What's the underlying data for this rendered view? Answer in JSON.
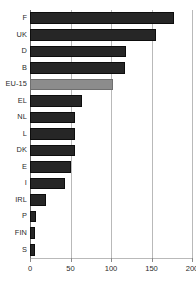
{
  "chart_data": {
    "type": "bar",
    "orientation": "horizontal",
    "title": "",
    "xlabel": "",
    "ylabel": "",
    "xlim": [
      0,
      200
    ],
    "ylim": null,
    "grid": true,
    "legend": null,
    "xticks": [
      0,
      50,
      100,
      150,
      200
    ],
    "xtick_labels": [
      "0",
      "50",
      "100",
      "150",
      "200"
    ],
    "categories": [
      "F",
      "UK",
      "D",
      "B",
      "EU-15",
      "EL",
      "NL",
      "L",
      "DK",
      "E",
      "I",
      "IRL",
      "P",
      "FIN",
      "S"
    ],
    "values": [
      178,
      155,
      118,
      117,
      102,
      64,
      56,
      55,
      55,
      51,
      43,
      20,
      7,
      6,
      6
    ],
    "bars": [
      {
        "label": "F",
        "value": 178,
        "color": "#262626",
        "highlight": false
      },
      {
        "label": "UK",
        "value": 155,
        "color": "#262626",
        "highlight": false
      },
      {
        "label": "D",
        "value": 118,
        "color": "#262626",
        "highlight": false
      },
      {
        "label": "B",
        "value": 117,
        "color": "#262626",
        "highlight": false
      },
      {
        "label": "EU-15",
        "value": 102,
        "color": "#8c8c8c",
        "highlight": true
      },
      {
        "label": "EL",
        "value": 64,
        "color": "#262626",
        "highlight": false
      },
      {
        "label": "NL",
        "value": 56,
        "color": "#262626",
        "highlight": false
      },
      {
        "label": "L",
        "value": 55,
        "color": "#262626",
        "highlight": false
      },
      {
        "label": "DK",
        "value": 55,
        "color": "#262626",
        "highlight": false
      },
      {
        "label": "E",
        "value": 51,
        "color": "#262626",
        "highlight": false
      },
      {
        "label": "I",
        "value": 43,
        "color": "#262626",
        "highlight": false
      },
      {
        "label": "IRL",
        "value": 20,
        "color": "#262626",
        "highlight": false
      },
      {
        "label": "P",
        "value": 7,
        "color": "#262626",
        "highlight": false
      },
      {
        "label": "FIN",
        "value": 6,
        "color": "#262626",
        "highlight": false
      },
      {
        "label": "S",
        "value": 6,
        "color": "#262626",
        "highlight": false
      }
    ],
    "colors": {
      "bar": "#262626",
      "highlight_bar": "#8c8c8c",
      "grid": "#b9b9b9",
      "axis": "#6d6d6d",
      "text": "#2b2b2b",
      "background": "#ffffff"
    }
  }
}
